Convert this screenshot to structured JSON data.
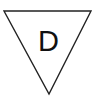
{
  "symbol": {
    "shape": "inverted-triangle",
    "label": "D",
    "stroke_color": "#222222",
    "fill_color": "#ffffff",
    "text_color": "#111111"
  }
}
